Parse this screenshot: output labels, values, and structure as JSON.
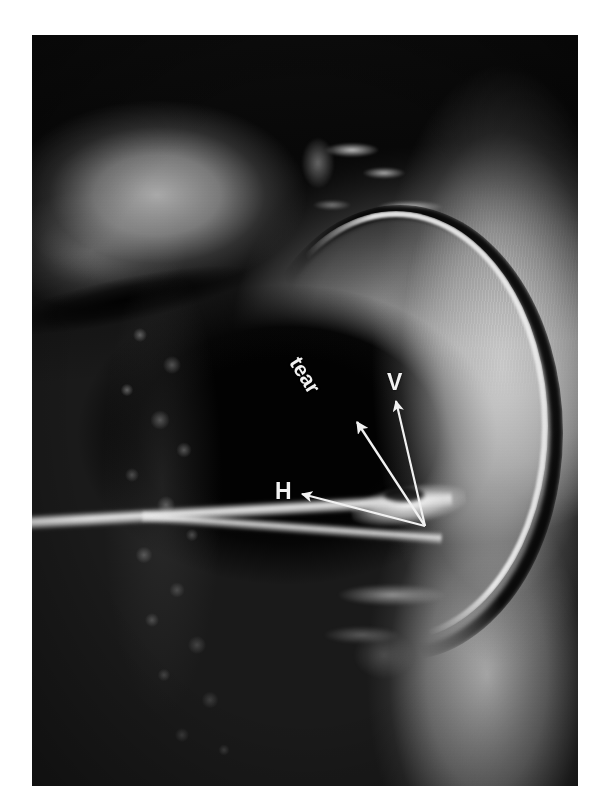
{
  "figure": {
    "modality": "MRI",
    "view": "sagittal knee",
    "background_color": "#ffffff",
    "plate_color": "#050505",
    "annotation_color": "#f2f2f2"
  },
  "annotations": [
    {
      "id": "tear",
      "label": "tear",
      "kind": "rotated-text-with-arrow",
      "arrow_tail": [
        393,
        491
      ],
      "arrow_head": [
        323,
        385
      ],
      "rotation_deg": 58
    },
    {
      "id": "vertical",
      "label": "V",
      "kind": "text-with-arrow",
      "arrow_tail": [
        393,
        491
      ],
      "arrow_head": [
        364,
        363
      ],
      "rotation_deg": 0
    },
    {
      "id": "horizontal",
      "label": "H",
      "kind": "text-with-arrow",
      "arrow_tail": [
        393,
        491
      ],
      "arrow_head": [
        268,
        458
      ],
      "rotation_deg": 0
    }
  ]
}
